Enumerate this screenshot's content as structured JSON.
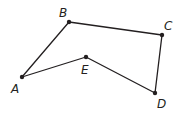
{
  "diagram": {
    "type": "polygon",
    "colors": {
      "stroke": "#231f20",
      "background": "#ffffff"
    },
    "vertices": [
      {
        "id": "A",
        "label": "A",
        "x": 22,
        "y": 77,
        "label_x": 11,
        "label_y": 93
      },
      {
        "id": "B",
        "label": "B",
        "x": 69,
        "y": 22,
        "label_x": 59,
        "label_y": 17
      },
      {
        "id": "C",
        "label": "C",
        "x": 162,
        "y": 35,
        "label_x": 164,
        "label_y": 30
      },
      {
        "id": "D",
        "label": "D",
        "x": 155,
        "y": 93,
        "label_x": 157,
        "label_y": 108
      },
      {
        "id": "E",
        "label": "E",
        "x": 86,
        "y": 57,
        "label_x": 81,
        "label_y": 74
      }
    ],
    "edges": [
      [
        "A",
        "B"
      ],
      [
        "B",
        "C"
      ],
      [
        "C",
        "D"
      ],
      [
        "D",
        "E"
      ],
      [
        "E",
        "A"
      ]
    ]
  }
}
